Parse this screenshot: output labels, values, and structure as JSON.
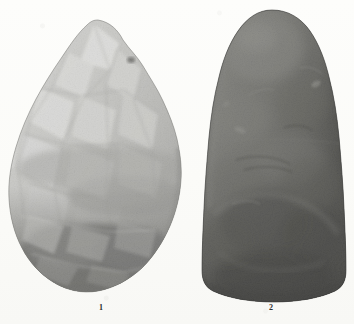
{
  "plate": {
    "kind": "archaeological-photographic-plate",
    "background_color": "#fcfcfa",
    "caption_color": "#2b2b2b"
  },
  "figures": [
    {
      "number": "1",
      "name": "flaked-stone-biface",
      "description": "Chipped flint biface / hand-axe, pointed ovate form with broad flake scars",
      "tone": "light gray",
      "colors": {
        "highlight": "#e3e3e1",
        "mid": "#b4b4b1",
        "shadow": "#6e6e6b",
        "deep_shadow": "#434341",
        "outline": "#5d5d5a"
      },
      "label_x": 101,
      "label_y": 306
    },
    {
      "number": "2",
      "name": "polished-stone-celt",
      "description": "Ground and polished stone celt, domed bullet-shaped outline with smooth surface",
      "tone": "dark gray",
      "colors": {
        "highlight": "#9a9a96",
        "mid": "#6b6b68",
        "shadow": "#484846",
        "deep_shadow": "#2c2c2b",
        "outline": "#2a2a29"
      },
      "label_x": 270,
      "label_y": 306
    }
  ]
}
